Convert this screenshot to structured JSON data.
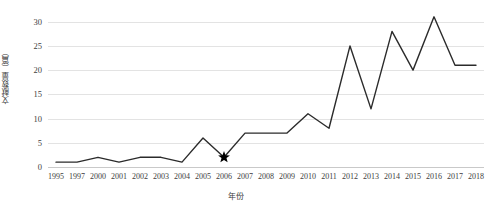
{
  "chart_data": {
    "type": "line",
    "title": "",
    "xlabel": "年份",
    "ylabel": "文献数量（篇）",
    "categories": [
      "1995",
      "1997",
      "2000",
      "2001",
      "2002",
      "2003",
      "2004",
      "2005",
      "2006",
      "2007",
      "2008",
      "2009",
      "2010",
      "2011",
      "2012",
      "2013",
      "2014",
      "2015",
      "2016",
      "2017",
      "2018"
    ],
    "values": [
      1,
      1,
      2,
      1,
      2,
      2,
      1,
      6,
      2,
      7,
      7,
      7,
      11,
      8,
      25,
      12,
      28,
      20,
      31,
      21,
      21
    ],
    "series": [
      {
        "name": "文献数量",
        "values": [
          1,
          1,
          2,
          1,
          2,
          2,
          1,
          6,
          2,
          7,
          7,
          7,
          11,
          8,
          25,
          12,
          28,
          20,
          31,
          21,
          21
        ],
        "color": "#2b2b2b"
      }
    ],
    "ylim": [
      0,
      32
    ],
    "yticks": [
      0,
      5,
      10,
      15,
      20,
      25,
      30
    ],
    "ytick_labels": [
      "0",
      "5",
      "10",
      "15",
      "20",
      "25",
      "30"
    ],
    "grid": true,
    "legend": false,
    "annotations": [
      {
        "marker": "star",
        "category": "2006",
        "value": 2,
        "color": "#000000"
      }
    ]
  }
}
